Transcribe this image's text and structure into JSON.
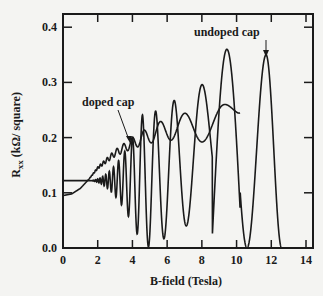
{
  "chart_data": {
    "type": "line",
    "title": "",
    "xlabel": "B-field (Tesla)",
    "ylabel": "R_xx (kΩ/ square)",
    "ylabel_main": "R",
    "ylabel_sub": "xx",
    "ylabel_rest": " (kΩ/ square)",
    "xlim": [
      0,
      14
    ],
    "ylim": [
      0.0,
      0.42
    ],
    "xticks": [
      "0",
      "2",
      "4",
      "6",
      "8",
      "10",
      "12",
      "14"
    ],
    "yticks": [
      "0.0",
      "0.1",
      "0.2",
      "0.3",
      "0.4"
    ],
    "grid": false,
    "legend": "none",
    "annotations": [
      {
        "text": "doped cap",
        "x": 3.9,
        "y": 0.2,
        "label_pos": [
          1.0,
          0.285
        ]
      },
      {
        "text": "undoped cap",
        "x": 11.7,
        "y": 0.35,
        "label_pos": [
          8.6,
          0.375
        ]
      }
    ],
    "series": [
      {
        "name": "doped cap",
        "description": "Shubnikov-de Haas oscillations on rising background, ending near B=10.2 T",
        "x": [
          0.0,
          0.5,
          1.0,
          1.5,
          2.0,
          3.0,
          4.0,
          5.0,
          6.0,
          7.0,
          8.0,
          9.0,
          10.0,
          10.2
        ],
        "y_mean": [
          0.095,
          0.098,
          0.108,
          0.125,
          0.145,
          0.172,
          0.19,
          0.205,
          0.215,
          0.22,
          0.222,
          0.225,
          0.24,
          0.245
        ],
        "amplitude": [
          0,
          0,
          0,
          0,
          0.002,
          0.006,
          0.01,
          0.015,
          0.02,
          0.024,
          0.03,
          0.035,
          0.02,
          0.01
        ]
      },
      {
        "name": "undoped cap",
        "description": "Large SdH oscillations around 0.12 growing to peaks ~0.36 at 9.5 T and ~0.35 at 11.7 T, dropping to 0 near 12.5 T",
        "peaks": [
          {
            "x": 6.7,
            "y": 0.255
          },
          {
            "x": 7.6,
            "y": 0.245
          },
          {
            "x": 8.0,
            "y": 0.25
          },
          {
            "x": 9.5,
            "y": 0.36
          },
          {
            "x": 11.7,
            "y": 0.35
          }
        ],
        "minima": [
          {
            "x": 6.2,
            "y": 0.065
          },
          {
            "x": 7.3,
            "y": 0.04
          },
          {
            "x": 8.6,
            "y": 0.02
          },
          {
            "x": 10.6,
            "y": 0.0
          },
          {
            "x": 12.6,
            "y": 0.0
          }
        ],
        "y_start": 0.122
      }
    ]
  },
  "colors": {
    "ink": "#1a1a1a",
    "paper": "#f4f4f2"
  }
}
